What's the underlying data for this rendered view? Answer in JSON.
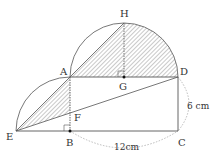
{
  "diagram": {
    "points": {
      "A": "A",
      "B": "B",
      "C": "C",
      "D": "D",
      "E": "E",
      "F": "F",
      "G": "G",
      "H": "H"
    },
    "measurements": {
      "bc": "12cm",
      "dc": "6 cm"
    },
    "colors": {
      "line": "#555555",
      "hatch": "#777777",
      "dotted": "#aaaaaa"
    }
  }
}
